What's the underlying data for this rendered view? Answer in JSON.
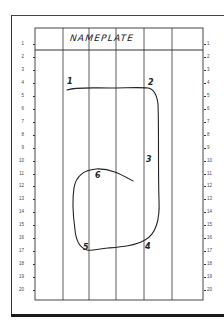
{
  "sheet": {
    "title": "NAMEPLATE",
    "row_numbers": [
      "1",
      "2",
      "3",
      "4",
      "5",
      "6",
      "7",
      "8",
      "9",
      "10",
      "11",
      "12",
      "13",
      "14",
      "15",
      "16",
      "17",
      "18",
      "19",
      "20"
    ],
    "columns": 6,
    "colors": {
      "ink": "#222222",
      "grid": "#333333",
      "paper": "#ffffff"
    }
  },
  "path": {
    "points": [
      {
        "label": "1",
        "x": 69,
        "y": 83
      },
      {
        "label": "2",
        "x": 150,
        "y": 84
      },
      {
        "label": "3",
        "x": 148,
        "y": 161
      },
      {
        "label": "4",
        "x": 146,
        "y": 248
      },
      {
        "label": "5",
        "x": 84,
        "y": 249
      },
      {
        "label": "6",
        "x": 96,
        "y": 177
      }
    ]
  }
}
